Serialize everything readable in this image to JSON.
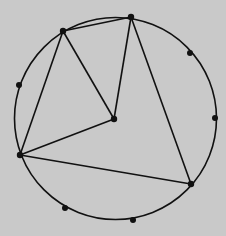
{
  "diagram": {
    "background": "#c9c9c9",
    "stroke": "#111111",
    "circle": {
      "cx": 115.5,
      "cy": 118.5,
      "r": 101
    },
    "vertices": [
      {
        "id": "A",
        "x": 63,
        "y": 31
      },
      {
        "id": "B",
        "x": 131,
        "y": 17
      },
      {
        "id": "C",
        "x": 114,
        "y": 119
      },
      {
        "id": "D",
        "x": 20,
        "y": 155
      },
      {
        "id": "E",
        "x": 191,
        "y": 184
      }
    ],
    "extra_points": [
      {
        "x": 19,
        "y": 85
      },
      {
        "x": 190,
        "y": 53
      },
      {
        "x": 215,
        "y": 118
      },
      {
        "x": 65,
        "y": 208
      },
      {
        "x": 133,
        "y": 220
      }
    ],
    "edges": [
      [
        "A",
        "B"
      ],
      [
        "A",
        "D"
      ],
      [
        "A",
        "C"
      ],
      [
        "B",
        "C"
      ],
      [
        "B",
        "E"
      ],
      [
        "C",
        "D"
      ],
      [
        "D",
        "E"
      ]
    ]
  }
}
